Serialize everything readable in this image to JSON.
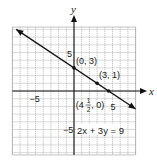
{
  "chart_data": {
    "type": "line",
    "title": "",
    "equation": "2x + 3y = 9",
    "xlabel": "x",
    "ylabel": "y",
    "xlim": [
      -8,
      8
    ],
    "ylim": [
      -8.3,
      8.3
    ],
    "grid": true,
    "grid_step": 1,
    "tick_labels": {
      "x": [
        {
          "value": -5,
          "label": "−5"
        },
        {
          "value": 5,
          "label": "5"
        }
      ],
      "y": [
        {
          "value": 5,
          "label": "5"
        },
        {
          "value": -5,
          "label": "−5"
        }
      ]
    },
    "series": [
      {
        "name": "2x + 3y = 9",
        "slope": -0.6667,
        "intercept": 3,
        "x": [
          -7.5,
          8
        ],
        "y": [
          8,
          -2.33
        ],
        "arrows": "both"
      }
    ],
    "points": [
      {
        "x": 0,
        "y": 3,
        "label": "(0, 3)"
      },
      {
        "x": 3,
        "y": 1,
        "label": "(3, 1)"
      },
      {
        "x": 4.5,
        "y": 0,
        "label_pre": "(4",
        "label_num": "1",
        "label_den": "2",
        "label_post": ", 0)"
      }
    ],
    "colors": {
      "grid": "#9a9a9a",
      "axis": "#111111",
      "line": "#111111"
    }
  }
}
